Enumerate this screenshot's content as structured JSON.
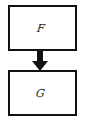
{
  "diagram": {
    "type": "flowchart",
    "nodes": [
      {
        "id": "F",
        "label": "F"
      },
      {
        "id": "G",
        "label": "G"
      }
    ],
    "edges": [
      {
        "from": "F",
        "to": "G",
        "style": "thick-arrow"
      }
    ],
    "colors": {
      "stroke": "#111111",
      "background": "#ffffff",
      "text": "#222222"
    }
  }
}
